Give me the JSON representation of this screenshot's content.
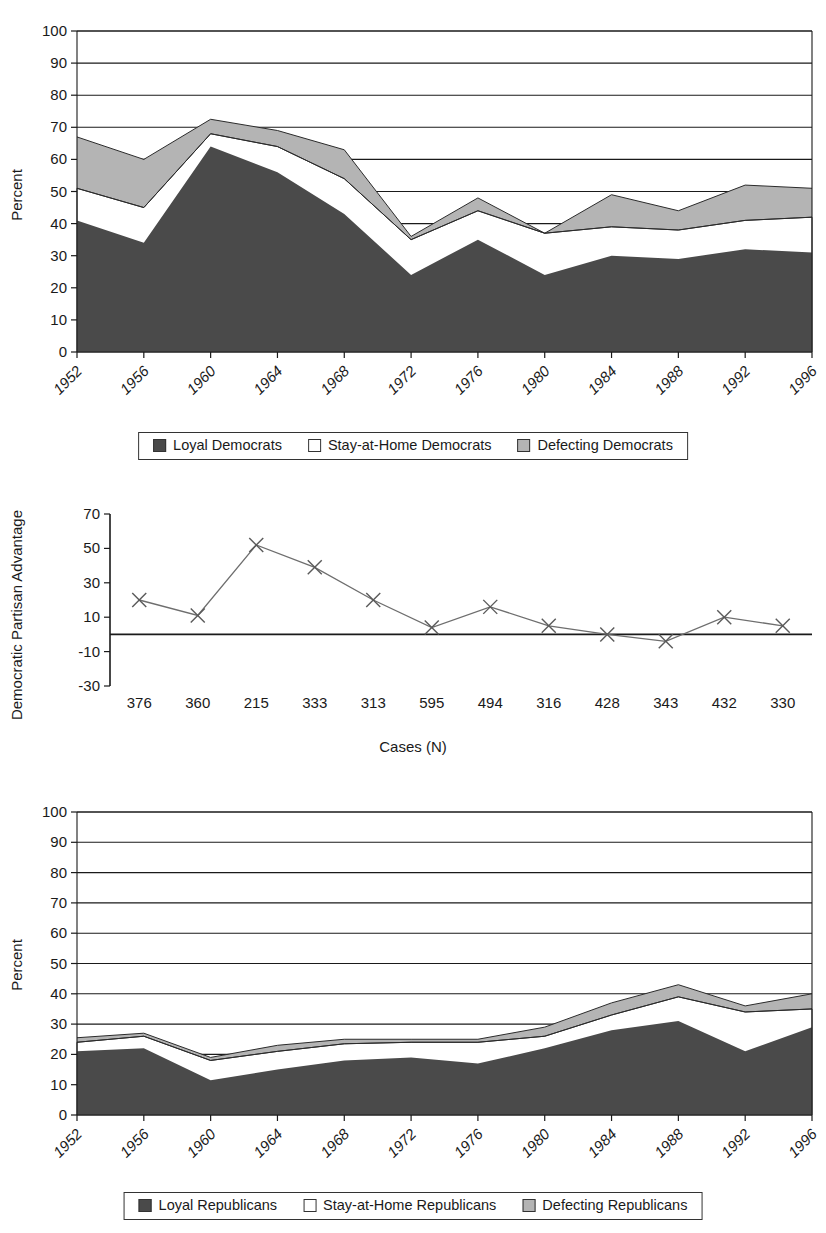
{
  "chart_data": [
    {
      "id": "democrats",
      "type": "area",
      "stacked": true,
      "title": "",
      "xlabel": "",
      "ylabel": "Percent",
      "ylim": [
        0,
        100
      ],
      "ytick_step": 10,
      "grid": true,
      "legend_position": "bottom",
      "categories": [
        "1952",
        "1956",
        "1960",
        "1964",
        "1968",
        "1972",
        "1976",
        "1980",
        "1984",
        "1988",
        "1992",
        "1996"
      ],
      "series": [
        {
          "name": "Loyal Democrats",
          "color": "#4a4a4a",
          "values": [
            41,
            34,
            64,
            56,
            43,
            24,
            35,
            24,
            30,
            29,
            32,
            31
          ]
        },
        {
          "name": "Stay-at-Home Democrats",
          "color": "#ffffff",
          "values": [
            10,
            11,
            4,
            8,
            11,
            11,
            9,
            13,
            9,
            9,
            9,
            11
          ]
        },
        {
          "name": "Defecting Democrats",
          "color": "#b4b4b4",
          "values": [
            16,
            15,
            4.5,
            5,
            9,
            1,
            4,
            0,
            10,
            6,
            11,
            9
          ]
        }
      ],
      "stack_tops": {
        "loyal": [
          41,
          34,
          64,
          56,
          43,
          24,
          35,
          24,
          30,
          29,
          32,
          31
        ],
        "stay": [
          51,
          45,
          68,
          64,
          54,
          35,
          44,
          37,
          39,
          38,
          41,
          42
        ],
        "defect": [
          67,
          60,
          72.5,
          69,
          63,
          36,
          48,
          37,
          49,
          44,
          52,
          51
        ]
      }
    },
    {
      "id": "advantage",
      "type": "line",
      "title": "",
      "xlabel": "Cases (N)",
      "ylabel": "Democratic Partisan Advantage",
      "ylim": [
        -30,
        70
      ],
      "ytick_step": 20,
      "yticks": [
        -30,
        -10,
        10,
        30,
        50,
        70
      ],
      "grid": false,
      "marker": "x",
      "categories": [
        "376",
        "360",
        "215",
        "333",
        "313",
        "595",
        "494",
        "316",
        "428",
        "343",
        "432",
        "330"
      ],
      "values": [
        20,
        11,
        52,
        39,
        20,
        4,
        16,
        5,
        0,
        -4,
        10,
        5
      ]
    },
    {
      "id": "republicans",
      "type": "area",
      "stacked": true,
      "title": "",
      "xlabel": "",
      "ylabel": "Percent",
      "ylim": [
        0,
        100
      ],
      "ytick_step": 10,
      "grid": true,
      "legend_position": "bottom",
      "categories": [
        "1952",
        "1956",
        "1960",
        "1964",
        "1968",
        "1972",
        "1976",
        "1980",
        "1984",
        "1988",
        "1992",
        "1996"
      ],
      "series": [
        {
          "name": "Loyal Republicans",
          "color": "#4a4a4a",
          "values": [
            21,
            22,
            11.5,
            15,
            18,
            19,
            17,
            22,
            28,
            31,
            21,
            29
          ]
        },
        {
          "name": "Stay-at-Home Republicans",
          "color": "#ffffff",
          "values": [
            3.0,
            4.0,
            6.5,
            6,
            5.5,
            5,
            7,
            4,
            5,
            8,
            13,
            6
          ]
        },
        {
          "name": "Defecting Republicans",
          "color": "#b4b4b4",
          "values": [
            1.5,
            1.0,
            1.0,
            2,
            1.5,
            1,
            1,
            3,
            4,
            4,
            2,
            5
          ]
        }
      ],
      "stack_tops": {
        "loyal": [
          21,
          22,
          11.5,
          15,
          18,
          19,
          17,
          22,
          28,
          31,
          21,
          29
        ],
        "stay": [
          24,
          26,
          18,
          21,
          23.5,
          24,
          24,
          26,
          33,
          39,
          34,
          35
        ],
        "defect": [
          25.5,
          27,
          19,
          23,
          25,
          25,
          25,
          29,
          37,
          43,
          36,
          40
        ]
      }
    }
  ],
  "panels": {
    "democrats": {
      "y_axis_title": "Percent",
      "y_ticks": [
        "0",
        "10",
        "20",
        "30",
        "40",
        "50",
        "60",
        "70",
        "80",
        "90",
        "100"
      ],
      "x_ticks": [
        "1952",
        "1956",
        "1960",
        "1964",
        "1968",
        "1972",
        "1976",
        "1980",
        "1984",
        "1988",
        "1992",
        "1996"
      ],
      "legend": {
        "loyal": "Loyal Democrats",
        "stay": "Stay-at-Home Democrats",
        "defect": "Defecting Democrats"
      }
    },
    "advantage": {
      "y_axis_title": "Democratic Partisan Advantage",
      "x_axis_title": "Cases (N)",
      "y_ticks": [
        "-30",
        "-10",
        "10",
        "30",
        "50",
        "70"
      ],
      "x_ticks": [
        "376",
        "360",
        "215",
        "333",
        "313",
        "595",
        "494",
        "316",
        "428",
        "343",
        "432",
        "330"
      ]
    },
    "republicans": {
      "y_axis_title": "Percent",
      "y_ticks": [
        "0",
        "10",
        "20",
        "30",
        "40",
        "50",
        "60",
        "70",
        "80",
        "90",
        "100"
      ],
      "x_ticks": [
        "1952",
        "1956",
        "1960",
        "1964",
        "1968",
        "1972",
        "1976",
        "1980",
        "1984",
        "1988",
        "1992",
        "1996"
      ],
      "legend": {
        "loyal": "Loyal Republicans",
        "stay": "Stay-at-Home Republicans",
        "defect": "Defecting Republicans"
      }
    }
  },
  "colors": {
    "loyal": "#4a4a4a",
    "stay": "#ffffff",
    "defect": "#b4b4b4",
    "axis": "#1a1a1a",
    "line": "#6e6e6e"
  }
}
